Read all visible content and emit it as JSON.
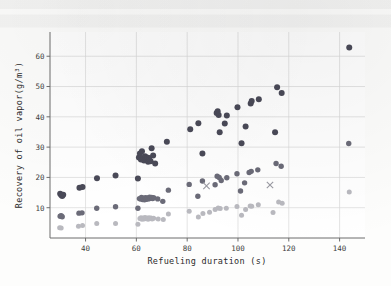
{
  "figure": {
    "background_color": "#fdfdfc",
    "plot_background_color": "#ffffff",
    "axis_color": "#6d6d6d",
    "grid_color": "#d8d8d8"
  },
  "chart_data": {
    "type": "scatter",
    "title": "",
    "xlabel": "Refueling duration (s)",
    "ylabel": "Recovery of oil vapor(g/m³)",
    "xlim": [
      26,
      150
    ],
    "ylim": [
      0,
      68
    ],
    "xticks": [
      40,
      60,
      80,
      100,
      120,
      140
    ],
    "yticks": [
      10,
      20,
      30,
      40,
      50,
      60
    ],
    "xtick_labels": [
      "40",
      "60",
      "80",
      "100",
      "120",
      "140"
    ],
    "ytick_labels": [
      "10",
      "20",
      "30",
      "40",
      "50",
      "60"
    ],
    "grid": true,
    "legend": "none",
    "series": [
      {
        "name": "high-recovery-group",
        "marker": "circle",
        "color": "#4a4a58",
        "size": 3.0,
        "points": [
          [
            30.0,
            14.6
          ],
          [
            30.4,
            14.2
          ],
          [
            30.8,
            13.9
          ],
          [
            31.2,
            14.3
          ],
          [
            37.6,
            16.6
          ],
          [
            38.8,
            16.8
          ],
          [
            44.5,
            19.7
          ],
          [
            51.8,
            20.6
          ],
          [
            60.6,
            19.6
          ],
          [
            61.0,
            26.6
          ],
          [
            61.4,
            27.9
          ],
          [
            61.8,
            25.9
          ],
          [
            62.2,
            28.6
          ],
          [
            62.6,
            26.3
          ],
          [
            63.0,
            25.6
          ],
          [
            63.4,
            27.0
          ],
          [
            63.8,
            26.1
          ],
          [
            64.2,
            26.6
          ],
          [
            64.6,
            25.2
          ],
          [
            65.0,
            26.4
          ],
          [
            65.6,
            25.3
          ],
          [
            66.0,
            29.6
          ],
          [
            66.6,
            27.2
          ],
          [
            67.4,
            24.6
          ],
          [
            72.0,
            31.8
          ],
          [
            81.2,
            35.9
          ],
          [
            84.4,
            37.9
          ],
          [
            86.0,
            27.9
          ],
          [
            91.6,
            41.3
          ],
          [
            92.0,
            41.8
          ],
          [
            92.4,
            40.6
          ],
          [
            92.8,
            34.9
          ],
          [
            94.8,
            37.8
          ],
          [
            95.6,
            40.4
          ],
          [
            99.8,
            43.2
          ],
          [
            101.4,
            31.3
          ],
          [
            103.0,
            36.8
          ],
          [
            105.0,
            44.4
          ],
          [
            105.4,
            45.2
          ],
          [
            108.2,
            45.8
          ],
          [
            114.6,
            34.9
          ],
          [
            115.4,
            49.8
          ],
          [
            117.2,
            47.9
          ],
          [
            143.8,
            62.9
          ]
        ]
      },
      {
        "name": "mid-recovery-group",
        "marker": "circle",
        "color": "#6b6b78",
        "size": 2.7,
        "points": [
          [
            30.0,
            7.2
          ],
          [
            30.4,
            7.4
          ],
          [
            30.8,
            7.0
          ],
          [
            37.4,
            8.2
          ],
          [
            38.6,
            8.3
          ],
          [
            44.4,
            9.8
          ],
          [
            51.8,
            10.3
          ],
          [
            60.6,
            9.8
          ],
          [
            61.2,
            13.0
          ],
          [
            61.6,
            12.9
          ],
          [
            62.0,
            13.4
          ],
          [
            62.4,
            12.7
          ],
          [
            62.8,
            13.1
          ],
          [
            63.2,
            12.6
          ],
          [
            63.6,
            13.3
          ],
          [
            64.0,
            12.8
          ],
          [
            64.4,
            13.2
          ],
          [
            64.8,
            12.9
          ],
          [
            65.2,
            13.5
          ],
          [
            65.6,
            13.1
          ],
          [
            66.0,
            13.4
          ],
          [
            66.4,
            13.0
          ],
          [
            66.8,
            13.3
          ],
          [
            68.4,
            12.9
          ],
          [
            70.4,
            12.1
          ],
          [
            72.6,
            15.8
          ],
          [
            80.8,
            17.7
          ],
          [
            84.2,
            13.8
          ],
          [
            86.0,
            18.8
          ],
          [
            91.0,
            17.6
          ],
          [
            91.8,
            20.4
          ],
          [
            92.6,
            20.0
          ],
          [
            93.4,
            19.0
          ],
          [
            95.6,
            19.9
          ],
          [
            99.6,
            21.2
          ],
          [
            101.0,
            15.5
          ],
          [
            102.6,
            18.2
          ],
          [
            104.4,
            21.6
          ],
          [
            105.2,
            22.0
          ],
          [
            107.8,
            22.5
          ],
          [
            115.0,
            24.6
          ],
          [
            117.0,
            23.7
          ],
          [
            143.6,
            31.2
          ]
        ]
      },
      {
        "name": "low-recovery-group",
        "marker": "circle",
        "color": "#b9b9bf",
        "size": 2.5,
        "points": [
          [
            29.8,
            3.4
          ],
          [
            30.4,
            3.3
          ],
          [
            37.2,
            3.9
          ],
          [
            38.8,
            4.1
          ],
          [
            44.4,
            4.8
          ],
          [
            51.8,
            4.8
          ],
          [
            60.6,
            4.5
          ],
          [
            61.4,
            6.4
          ],
          [
            61.8,
            6.7
          ],
          [
            62.2,
            6.2
          ],
          [
            62.6,
            6.6
          ],
          [
            63.0,
            6.3
          ],
          [
            63.4,
            6.8
          ],
          [
            63.8,
            6.4
          ],
          [
            64.2,
            6.6
          ],
          [
            64.6,
            6.2
          ],
          [
            65.0,
            6.7
          ],
          [
            65.4,
            6.4
          ],
          [
            65.8,
            6.6
          ],
          [
            66.2,
            6.3
          ],
          [
            66.8,
            6.5
          ],
          [
            68.6,
            6.3
          ],
          [
            70.6,
            6.1
          ],
          [
            72.6,
            7.9
          ],
          [
            80.8,
            8.8
          ],
          [
            84.4,
            6.9
          ],
          [
            86.2,
            8.1
          ],
          [
            88.8,
            8.5
          ],
          [
            91.0,
            9.4
          ],
          [
            92.2,
            9.9
          ],
          [
            93.0,
            9.7
          ],
          [
            95.4,
            9.8
          ],
          [
            99.6,
            10.4
          ],
          [
            101.4,
            7.5
          ],
          [
            103.0,
            9.4
          ],
          [
            104.8,
            10.6
          ],
          [
            105.4,
            10.5
          ],
          [
            108.0,
            11.0
          ],
          [
            113.8,
            8.4
          ],
          [
            116.0,
            11.9
          ],
          [
            117.4,
            11.5
          ],
          [
            143.8,
            15.2
          ]
        ]
      },
      {
        "name": "x-marker-group",
        "marker": "x",
        "color": "#9a9aa2",
        "size": 3.2,
        "points": [
          [
            87.6,
            17.2
          ],
          [
            112.6,
            17.5
          ]
        ]
      }
    ]
  }
}
